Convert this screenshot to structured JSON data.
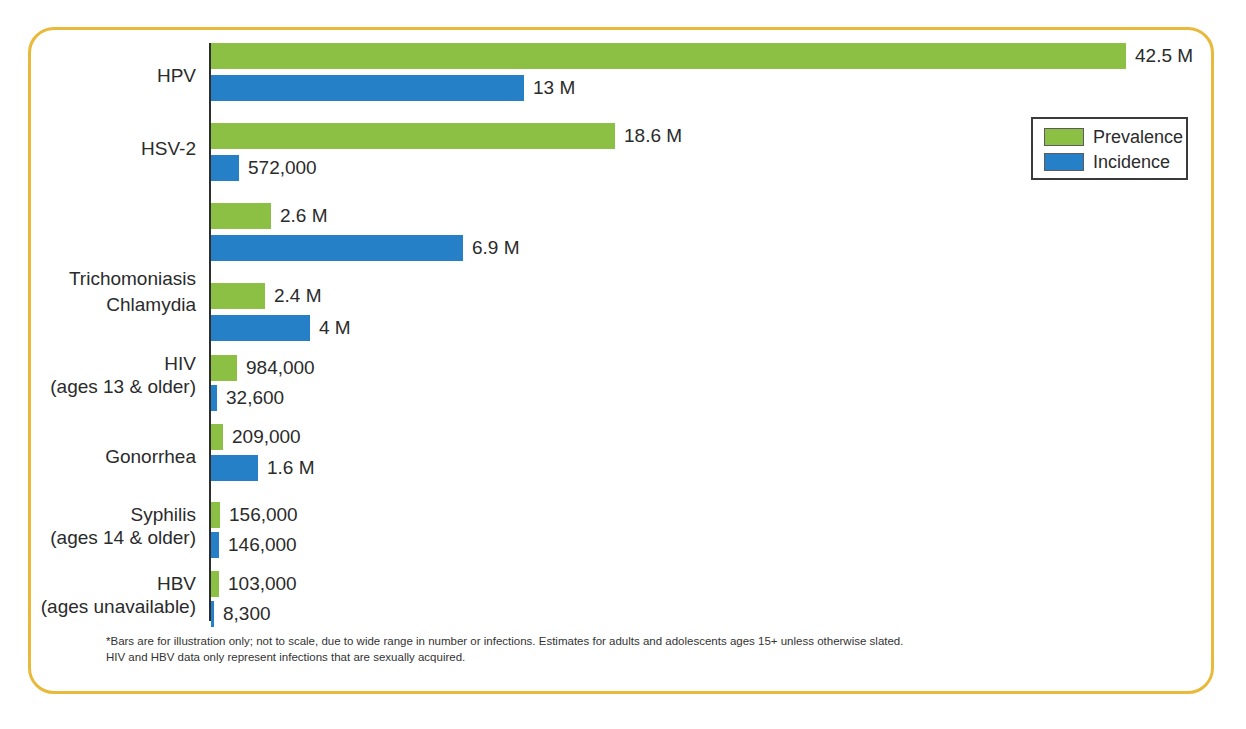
{
  "chart_data": {
    "type": "bar",
    "orientation": "horizontal",
    "title": "",
    "xlabel": "",
    "ylabel": "",
    "grid": false,
    "scale_note": "not to scale",
    "legend": {
      "position": "top-right",
      "entries": [
        {
          "name": "Prevalence",
          "color": "#8cc044"
        },
        {
          "name": "Incidence",
          "color": "#2580c8"
        }
      ]
    },
    "categories": [
      "HPV",
      "HSV-2",
      "Trichomoniasis",
      "Chlamydia",
      "HIV",
      "Gonorrhea",
      "Syphilis",
      "HBV"
    ],
    "category_sublabels": [
      "",
      "",
      "",
      "",
      "(ages 13 & older)",
      "",
      "(ages 14 & older)",
      "(ages unavailable)"
    ],
    "series": [
      {
        "name": "Prevalence",
        "color": "#8cc044",
        "values": [
          42500000,
          18600000,
          2600000,
          2400000,
          984000,
          209000,
          156000,
          103000
        ],
        "labels": [
          "42.5 M",
          "18.6 M",
          "2.6 M",
          "2.4 M",
          "984,000",
          "209,000",
          "156,000",
          "103,000"
        ]
      },
      {
        "name": "Incidence",
        "color": "#2580c8",
        "values": [
          13000000,
          572000,
          6900000,
          4000000,
          32600,
          1600000,
          146000,
          8300
        ],
        "labels": [
          "13 M",
          "572,000",
          "6.9 M",
          "4 M",
          "32,600",
          "1.6 M",
          "146,000",
          "8,300"
        ]
      }
    ]
  },
  "rows": [
    {
      "category": "HPV",
      "sublabel": "",
      "label_top": 64,
      "row_top": 43,
      "bars": [
        {
          "series": "Prevalence",
          "value_label": "42.5 M",
          "width": 915,
          "top": 43
        },
        {
          "series": "Incidence",
          "value_label": "13 M",
          "width": 313,
          "top": 75
        }
      ]
    },
    {
      "category": "HSV-2",
      "sublabel": "",
      "label_top": 137,
      "row_top": 123,
      "bars": [
        {
          "series": "Prevalence",
          "value_label": "18.6 M",
          "width": 404,
          "top": 123
        },
        {
          "series": "Incidence",
          "value_label": "572,000",
          "width": 28,
          "top": 155
        }
      ]
    },
    {
      "category": "Trichomoniasis",
      "sublabel": "",
      "label_top": 267,
      "row_top": 203,
      "bars": [
        {
          "series": "Prevalence",
          "value_label": "2.6 M",
          "width": 60,
          "top": 203
        },
        {
          "series": "Incidence",
          "value_label": "6.9 M",
          "width": 252,
          "top": 235
        }
      ]
    },
    {
      "category": "Chlamydia",
      "sublabel": "",
      "label_top": 293,
      "row_top": 283,
      "bars": [
        {
          "series": "Prevalence",
          "value_label": "2.4 M",
          "width": 54,
          "top": 283
        },
        {
          "series": "Incidence",
          "value_label": "4 M",
          "width": 99,
          "top": 315
        }
      ]
    },
    {
      "category": "HIV",
      "sublabel": "(ages 13 & older)",
      "label_top": 352,
      "row_top": 355,
      "bars": [
        {
          "series": "Prevalence",
          "value_label": "984,000",
          "width": 26,
          "top": 355
        },
        {
          "series": "Incidence",
          "value_label": "32,600",
          "width": 6,
          "top": 385
        }
      ]
    },
    {
      "category": "Gonorrhea",
      "sublabel": "",
      "label_top": 445,
      "row_top": 424,
      "bars": [
        {
          "series": "Prevalence",
          "value_label": "209,000",
          "width": 12,
          "top": 424
        },
        {
          "series": "Incidence",
          "value_label": "1.6 M",
          "width": 47,
          "top": 455
        }
      ]
    },
    {
      "category": "Syphilis",
      "sublabel": "(ages 14 & older)",
      "label_top": 503,
      "row_top": 502,
      "bars": [
        {
          "series": "Prevalence",
          "value_label": "156,000",
          "width": 9,
          "top": 502
        },
        {
          "series": "Incidence",
          "value_label": "146,000",
          "width": 8,
          "top": 532
        }
      ]
    },
    {
      "category": "HBV",
      "sublabel": "(ages unavailable)",
      "label_top": 572,
      "row_top": 571,
      "bars": [
        {
          "series": "Prevalence",
          "value_label": "103,000",
          "width": 8,
          "top": 571
        },
        {
          "series": "Incidence",
          "value_label": "8,300",
          "width": 3,
          "top": 601
        }
      ]
    }
  ],
  "legend": {
    "items": [
      {
        "label": "Prevalence",
        "color": "#8cc044"
      },
      {
        "label": "Incidence",
        "color": "#2580c8"
      }
    ]
  },
  "footnote": {
    "line1": "*Bars are for illustration only; not to scale, due to wide range in number or infections. Estimates for adults and adolescents ages 15+ unless otherwise slated.",
    "line2": "HIV and HBV data only represent infections that are sexually acquired."
  },
  "colors": {
    "prevalence": "#8cc044",
    "incidence": "#2580c8",
    "frame": "#e8b93a",
    "axis": "#2e2e2e",
    "text": "#2b2b2b"
  }
}
